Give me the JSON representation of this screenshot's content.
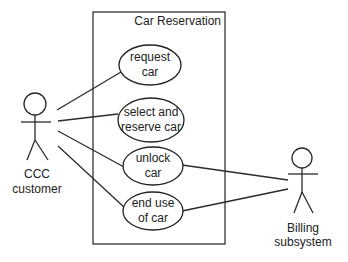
{
  "diagram": {
    "type": "uml-use-case",
    "system": {
      "title": "Car Reservation",
      "box": {
        "x": 93,
        "y": 12,
        "width": 132,
        "height": 232
      }
    },
    "use_cases": [
      {
        "id": "request",
        "line1": "request",
        "line2": "car",
        "cx": 150,
        "cy": 65,
        "rx": 31,
        "ry": 20
      },
      {
        "id": "select",
        "line1": "select and",
        "line2": "reserve car",
        "cx": 151,
        "cy": 120,
        "rx": 33,
        "ry": 22
      },
      {
        "id": "unlock",
        "line1": "unlock",
        "line2": "car",
        "cx": 153,
        "cy": 166,
        "rx": 30,
        "ry": 19
      },
      {
        "id": "enduse",
        "line1": "end use",
        "line2": "of car",
        "cx": 153,
        "cy": 211,
        "rx": 30,
        "ry": 19
      }
    ],
    "actors": [
      {
        "id": "customer",
        "line1": "CCC",
        "line2": "customer"
      },
      {
        "id": "billing",
        "line1": "Billing",
        "line2": "subsystem"
      }
    ],
    "associations": [
      {
        "from": "customer",
        "to": "request"
      },
      {
        "from": "customer",
        "to": "select"
      },
      {
        "from": "customer",
        "to": "unlock"
      },
      {
        "from": "customer",
        "to": "enduse"
      },
      {
        "from": "billing",
        "to": "unlock"
      },
      {
        "from": "billing",
        "to": "enduse"
      }
    ],
    "colors": {
      "line": "#2b2b2b",
      "background": "#ffffff",
      "text": "#222222"
    }
  }
}
